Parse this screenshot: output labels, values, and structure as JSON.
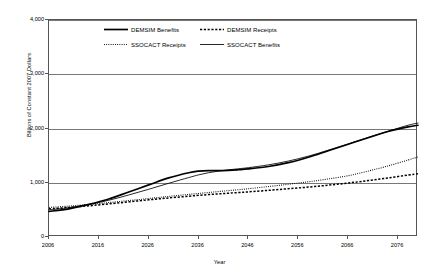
{
  "chart_data": {
    "type": "line",
    "title": "",
    "xlabel": "Year",
    "ylabel": "Billions of Constant 2007 Dollars",
    "xlim": [
      2006,
      2080
    ],
    "ylim": [
      0,
      4000
    ],
    "xticks": [
      "2006",
      "2016",
      "2026",
      "2036",
      "2046",
      "2056",
      "2066",
      "2076"
    ],
    "xtick_values": [
      2006,
      2016,
      2026,
      2036,
      2046,
      2056,
      2066,
      2076
    ],
    "yticks": [
      "0",
      "1,000",
      "2,000",
      "3,000",
      "4,000"
    ],
    "ytick_values": [
      0,
      1000,
      2000,
      3000,
      4000
    ],
    "grid": true,
    "legend_position": "top-center",
    "x": [
      2006,
      2010,
      2014,
      2018,
      2022,
      2026,
      2030,
      2034,
      2036,
      2038,
      2040,
      2042,
      2044,
      2046,
      2050,
      2054,
      2058,
      2062,
      2066,
      2070,
      2074,
      2078,
      2080
    ],
    "series": [
      {
        "name": "DEMSIM Benefits",
        "style": "solid-thick",
        "color": "#000000",
        "values": [
          470,
          520,
          600,
          700,
          830,
          960,
          1090,
          1185,
          1215,
          1225,
          1222,
          1228,
          1240,
          1255,
          1300,
          1370,
          1470,
          1590,
          1710,
          1830,
          1945,
          2030,
          2060
        ]
      },
      {
        "name": "DEMSIM Receipts",
        "style": "dashed",
        "color": "#000000",
        "values": [
          520,
          545,
          575,
          610,
          648,
          685,
          720,
          752,
          768,
          782,
          795,
          808,
          820,
          832,
          860,
          890,
          920,
          955,
          995,
          1040,
          1090,
          1140,
          1165
        ]
      },
      {
        "name": "SSOCACT Receipts",
        "style": "dotted",
        "color": "#000000",
        "values": [
          545,
          570,
          600,
          635,
          672,
          710,
          748,
          785,
          803,
          820,
          838,
          855,
          872,
          890,
          930,
          972,
          1018,
          1070,
          1130,
          1215,
          1310,
          1420,
          1475
        ]
      },
      {
        "name": "SSOCACT Benefits",
        "style": "solid-thin",
        "color": "#000000",
        "values": [
          500,
          540,
          600,
          678,
          775,
          880,
          990,
          1095,
          1145,
          1185,
          1215,
          1238,
          1258,
          1278,
          1330,
          1400,
          1490,
          1600,
          1715,
          1835,
          1950,
          2060,
          2100
        ]
      }
    ]
  },
  "axes": {
    "y_label": "Billions of Constant 2007 Dollars",
    "x_label": "Year"
  },
  "legend": {
    "entries": [
      {
        "label": "DEMSIM Benefits",
        "style": "solid-thick"
      },
      {
        "label": "DEMSIM Receipts",
        "style": "dashed"
      },
      {
        "label": "SSOCACT Receipts",
        "style": "dotted"
      },
      {
        "label": "SSOCACT Benefits",
        "style": "solid-thin"
      }
    ]
  }
}
